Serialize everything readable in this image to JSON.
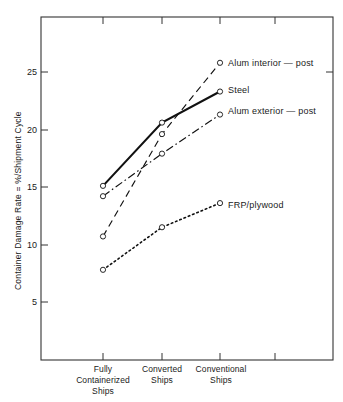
{
  "chart_data": {
    "type": "line",
    "title": "",
    "xlabel": "",
    "ylabel": "Container Damage Rate = %/Shipment Cycle",
    "categories": [
      "Fully Containerized Ships",
      "Converted Ships",
      "Conventional Ships"
    ],
    "category_lines": [
      [
        "Fully",
        "Containerized",
        "Ships"
      ],
      [
        "Converted",
        "Ships"
      ],
      [
        "Conventional",
        "Ships"
      ]
    ],
    "ylim": [
      0,
      28.5
    ],
    "yticks": [
      5,
      10,
      15,
      20,
      25
    ],
    "ytick_labels": [
      "5",
      "10",
      "15",
      "20",
      "25"
    ],
    "grid": false,
    "legend": "inline-right-of-last-point",
    "series": [
      {
        "name": "Alum interior - post",
        "label": "Alum interior — post",
        "style": "dashed",
        "marker": "open-circle",
        "values": [
          10.7,
          19.6,
          25.8
        ]
      },
      {
        "name": "Steel",
        "label": "Steel",
        "style": "solid",
        "marker": "open-circle",
        "values": [
          15.1,
          20.6,
          23.3
        ]
      },
      {
        "name": "Alum exterior - post",
        "label": "Alum exterior — post",
        "style": "dash-dot",
        "marker": "open-circle",
        "values": [
          14.2,
          17.9,
          21.3
        ]
      },
      {
        "name": "FRP/plywood",
        "label": "FRP/plywood",
        "style": "dotted",
        "marker": "open-circle",
        "values": [
          7.8,
          11.5,
          13.6
        ]
      }
    ],
    "colors": {
      "line": "#111111",
      "axis": "#333333",
      "background": "#ffffff"
    }
  }
}
